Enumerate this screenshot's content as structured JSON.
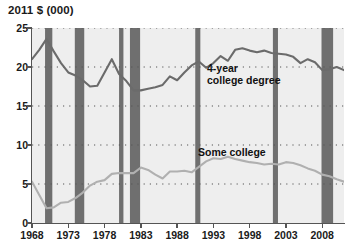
{
  "chart_data": {
    "type": "line",
    "title": "2011 $ (000)",
    "subtitle": "",
    "xlabel": "",
    "ylabel": "2011 $ (000)",
    "xlim": [
      1968,
      2011
    ],
    "ylim": [
      0,
      25
    ],
    "grid": true,
    "grid_style": "dotted horizontal",
    "legend_position": "inline annotations",
    "x_tick_labels": [
      "1968",
      "1973",
      "1978",
      "1983",
      "1988",
      "1993",
      "1998",
      "2003",
      "2008"
    ],
    "x_tick_values": [
      1968,
      1973,
      1978,
      1983,
      1988,
      1993,
      1998,
      2003,
      2008
    ],
    "y_tick_labels": [
      "0",
      "5",
      "10",
      "15",
      "20",
      "25"
    ],
    "y_tick_values": [
      0,
      5,
      10,
      15,
      20,
      25
    ],
    "x": [
      1968,
      1969,
      1970,
      1971,
      1972,
      1973,
      1974,
      1975,
      1976,
      1977,
      1978,
      1979,
      1980,
      1981,
      1982,
      1983,
      1984,
      1985,
      1986,
      1987,
      1988,
      1989,
      1990,
      1991,
      1992,
      1993,
      1994,
      1995,
      1996,
      1997,
      1998,
      1999,
      2000,
      2001,
      2002,
      2003,
      2004,
      2005,
      2006,
      2007,
      2008,
      2009,
      2010,
      2011
    ],
    "series": [
      {
        "name": "4-year college degree",
        "label": "4-year\ncollege degree",
        "color": "#6b6b6b",
        "values": [
          21.0,
          22.2,
          23.6,
          22.0,
          20.5,
          19.3,
          18.9,
          18.3,
          17.5,
          17.6,
          19.3,
          21.0,
          19.1,
          18.2,
          17.0,
          17.0,
          17.2,
          17.4,
          17.7,
          18.8,
          18.3,
          19.3,
          20.2,
          20.7,
          19.9,
          20.5,
          21.4,
          20.8,
          22.2,
          22.4,
          22.1,
          21.9,
          22.1,
          21.8,
          21.7,
          21.6,
          21.3,
          20.5,
          21.0,
          20.6,
          19.6,
          19.7,
          20.0,
          19.6
        ]
      },
      {
        "name": "Some college",
        "label": "Some college",
        "color": "#b0b0b0",
        "values": [
          5.3,
          3.6,
          1.9,
          2.0,
          2.6,
          2.7,
          3.2,
          3.9,
          4.8,
          5.3,
          5.5,
          6.3,
          6.4,
          6.4,
          6.4,
          7.1,
          6.8,
          6.2,
          5.7,
          6.6,
          6.6,
          6.7,
          6.5,
          7.2,
          7.9,
          8.3,
          8.2,
          8.5,
          8.2,
          8.0,
          7.8,
          7.7,
          7.5,
          7.6,
          7.5,
          7.8,
          7.7,
          7.4,
          7.0,
          6.7,
          6.2,
          6.0,
          5.6,
          5.3
        ]
      }
    ],
    "annotations": [
      {
        "text": "4-year college degree",
        "series": "4-year college degree"
      },
      {
        "text": "Some college",
        "series": "Some college"
      }
    ],
    "recession_bands": {
      "color": "#6f6f6f",
      "periods": [
        {
          "start": 1969.8,
          "end": 1970.8
        },
        {
          "start": 1973.9,
          "end": 1975.2
        },
        {
          "start": 1980.0,
          "end": 1980.6
        },
        {
          "start": 1981.5,
          "end": 1982.9
        },
        {
          "start": 1990.5,
          "end": 1991.2
        },
        {
          "start": 2001.2,
          "end": 2001.9
        },
        {
          "start": 2007.9,
          "end": 2009.5
        }
      ]
    },
    "plot_background": "#eeeeee"
  },
  "colors": {
    "four_year_line": "#6b6b6b",
    "some_college_line": "#b0b0b0",
    "recession_band": "#6f6f6f",
    "plot_bg": "#eeeeee",
    "axis": "#555555",
    "text": "#1a1a1a"
  }
}
